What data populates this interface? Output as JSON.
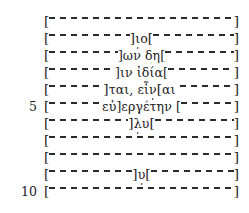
{
  "document": {
    "type": "greek-inscription-edition",
    "language": "Ancient Greek",
    "background_color": "#ffffff",
    "text_color": "#1c1c1c",
    "lacuna_symbol": "[------]",
    "bracket_open": "[",
    "bracket_close": "]",
    "line_count": 11
  },
  "lines": [
    {
      "number": "",
      "index": 1,
      "open_bracket": "[",
      "close_bracket": "]",
      "left_gap": true,
      "right_gap": false,
      "text": "",
      "full": "[----------------------]"
    },
    {
      "number": "",
      "index": 2,
      "open_bracket": "[",
      "close_bracket": "]",
      "left_gap": true,
      "right_gap": true,
      "text": "]ιο[",
      "greek_before": "]",
      "greek_core": "ιο",
      "greek_after": "[",
      "dotted_letters": "ι",
      "full": "[------------]ι̣ο[------]"
    },
    {
      "number": "",
      "index": 3,
      "open_bracket": "[",
      "close_bracket": "]",
      "left_gap": true,
      "right_gap": true,
      "text": "]ων δη[",
      "greek_core": "ων δη",
      "full": "[------------]ων δη[----]"
    },
    {
      "number": "",
      "index": 4,
      "open_bracket": "[",
      "close_bracket": "]",
      "left_gap": true,
      "right_gap": true,
      "text": "]ιν ἰδία[",
      "greek_core": "ιν ἰδία",
      "full": "[----------]ιν ἰδία[------]"
    },
    {
      "number": "",
      "index": 5,
      "open_bracket": "[",
      "close_bracket": "]",
      "left_gap": true,
      "right_gap": true,
      "text": "]ται, εἶν[αι",
      "greek_core": "]ται, εἶν[αι",
      "dotted_letters": "ν",
      "full": "[----------]ται, εἶν̣[αι ----]"
    },
    {
      "number": "5",
      "index": 6,
      "open_bracket": "[",
      "close_bracket": "]",
      "left_gap": true,
      "right_gap": true,
      "text": "εὐ]εργέτην [",
      "greek_core": "εὐ]εργέτην",
      "full": "[--------εὐ]εργέτην [------]"
    },
    {
      "number": "",
      "index": 7,
      "open_bracket": "[",
      "close_bracket": "]",
      "left_gap": true,
      "right_gap": true,
      "text": "]λυ[",
      "greek_core": "λυ",
      "dotted_letters": "λ",
      "full": "[-----------]λ̣υ[-------]"
    },
    {
      "number": "",
      "index": 8,
      "open_bracket": "[",
      "close_bracket": "]",
      "left_gap": true,
      "right_gap": false,
      "text": "",
      "full": "[----------------------]"
    },
    {
      "number": "",
      "index": 9,
      "open_bracket": "[",
      "close_bracket": "]",
      "left_gap": true,
      "right_gap": false,
      "text": "",
      "full": "[----------------------]"
    },
    {
      "number": "",
      "index": 10,
      "open_bracket": "[",
      "close_bracket": "]",
      "left_gap": true,
      "right_gap": true,
      "text": "]υ[",
      "greek_core": "υ",
      "dotted_letters": "υ",
      "full": "[------------]υ̣[--------]"
    },
    {
      "number": "10",
      "index": 11,
      "open_bracket": "[",
      "close_bracket": "]",
      "left_gap": true,
      "right_gap": false,
      "text": "",
      "full": "[----------------------]"
    }
  ]
}
